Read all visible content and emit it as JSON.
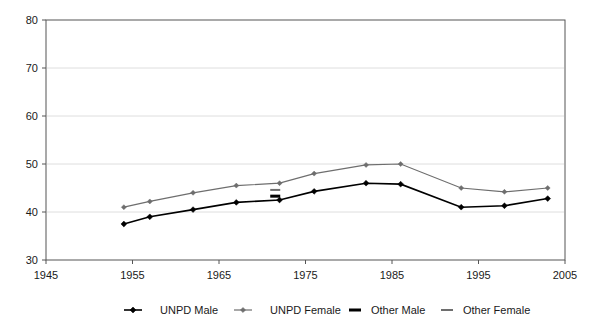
{
  "chart_data": {
    "type": "line",
    "title": "",
    "subtitle": "",
    "xlabel": "",
    "ylabel": "",
    "xlim": [
      1945,
      2005
    ],
    "ylim": [
      30,
      80
    ],
    "xticks": [
      1945,
      1955,
      1965,
      1975,
      1985,
      1995,
      2005
    ],
    "yticks": [
      30,
      40,
      50,
      60,
      70,
      80
    ],
    "grid": "horizontal",
    "legend_position": "bottom",
    "series": [
      {
        "name": "UNPD Male",
        "color": "#000000",
        "marker": "diamond",
        "style": "line-marker",
        "x": [
          1954,
          1957,
          1962,
          1967,
          1972,
          1976,
          1982,
          1986,
          1993,
          1998,
          2003
        ],
        "values": [
          37.5,
          39.0,
          40.5,
          42.0,
          42.5,
          44.3,
          46.0,
          45.8,
          41.0,
          41.3,
          42.8
        ]
      },
      {
        "name": "UNPD Female",
        "color": "#6e6e6e",
        "marker": "diamond",
        "style": "line-marker",
        "x": [
          1954,
          1957,
          1962,
          1967,
          1972,
          1976,
          1982,
          1986,
          1993,
          1998,
          2003
        ],
        "values": [
          41.0,
          42.2,
          44.0,
          45.5,
          46.0,
          48.0,
          49.8,
          50.0,
          45.0,
          44.2,
          45.0
        ]
      },
      {
        "name": "Other Male",
        "color": "#000000",
        "marker": "dash-thick",
        "style": "marker-only",
        "x": [
          1971.5
        ],
        "values": [
          43.3
        ]
      },
      {
        "name": "Other Female",
        "color": "#6e6e6e",
        "marker": "dash-thin",
        "style": "marker-only",
        "x": [
          1971.5
        ],
        "values": [
          44.6
        ]
      }
    ]
  },
  "axes": {
    "y_tick_labels": [
      "80",
      "70",
      "60",
      "50",
      "40",
      "30"
    ],
    "x_tick_labels": [
      "1945",
      "1955",
      "1965",
      "1975",
      "1985",
      "1995",
      "2005"
    ]
  },
  "legend": {
    "items": [
      {
        "label": "UNPD Male",
        "marker": "line-diamond-black"
      },
      {
        "label": "UNPD Female",
        "marker": "line-diamond-gray"
      },
      {
        "label": "Other Male",
        "marker": "dash-thick-black"
      },
      {
        "label": "Other Female",
        "marker": "dash-thin-gray"
      }
    ]
  },
  "colors": {
    "male": "#000000",
    "female": "#6e6e6e",
    "axis": "#555555",
    "grid": "#dedede",
    "background": "#ffffff"
  }
}
